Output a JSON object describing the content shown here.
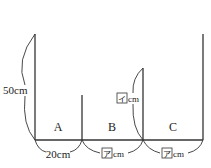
{
  "diagram": {
    "sections": [
      {
        "label": "A",
        "width_label": "20cm"
      },
      {
        "label": "B",
        "width_box": "ア",
        "width_unit": "cm"
      },
      {
        "label": "C",
        "width_box": "ア",
        "width_unit": "cm"
      }
    ],
    "height_labels": {
      "left": "50cm",
      "middle_box": "イ",
      "middle_unit": "cm"
    },
    "colors": {
      "line": "#333333",
      "background": "#ffffff"
    }
  }
}
